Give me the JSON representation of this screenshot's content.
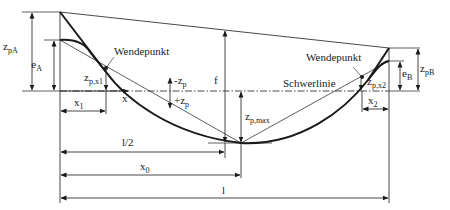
{
  "diagram": {
    "type": "tendon-profile",
    "colors": {
      "line": "#1a1a1a",
      "background": "#ffffff"
    },
    "labels": {
      "zpA": {
        "main": "z",
        "sub": "pA"
      },
      "eA": {
        "main": "e",
        "sub": "A"
      },
      "wendepunkt_left": "Wendepunkt",
      "zpx1": {
        "main": "z",
        "sub": "p,x1"
      },
      "x1": {
        "main": "x",
        "sub": "1"
      },
      "x_axis": "x",
      "minus_zp": {
        "main": "-z",
        "sub": "p"
      },
      "plus_zp": {
        "main": "+z",
        "sub": "p"
      },
      "f": "f",
      "schwerlinie": "Schwerlinie",
      "zpmax": {
        "main": "z",
        "sub": "p,max"
      },
      "wendepunkt_right": "Wendepunkt",
      "zpx2": {
        "main": "z",
        "sub": "p,x2"
      },
      "eB": {
        "main": "e",
        "sub": "B"
      },
      "zpB": {
        "main": "z",
        "sub": "pB"
      },
      "x2": {
        "main": "x",
        "sub": "2"
      },
      "l_half": "l/2",
      "x0": {
        "main": "x",
        "sub": "0"
      },
      "l": "l"
    }
  }
}
